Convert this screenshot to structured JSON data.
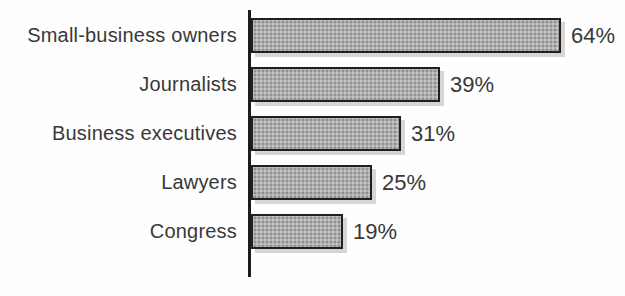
{
  "chart_data": {
    "type": "bar",
    "orientation": "horizontal",
    "title": "",
    "xlabel": "",
    "ylabel": "",
    "categories": [
      "Small-business owners",
      "Journalists",
      "Business executives",
      "Lawyers",
      "Congress"
    ],
    "values": [
      64,
      39,
      31,
      25,
      19
    ],
    "value_labels": [
      "64%",
      "39%",
      "31%",
      "25%",
      "19%"
    ],
    "xlim": [
      0,
      70
    ],
    "grid": false,
    "legend": null,
    "colors": {
      "bar_fill": "#b0afae",
      "bar_border": "#1f1f1f",
      "bar_shadow": "#d6d5d3",
      "axis": "#1c1c1c",
      "text": "#383838",
      "background": "#fefefe"
    }
  }
}
